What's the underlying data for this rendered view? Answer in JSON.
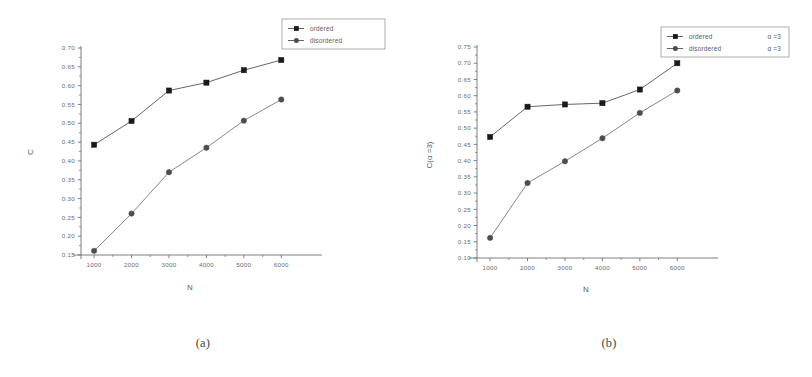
{
  "figure": {
    "panels": [
      {
        "id": "a",
        "caption": "(a)",
        "legend": {
          "entries": [
            {
              "label": "ordered",
              "marker": "square-marker"
            },
            {
              "label": "disordered",
              "marker": "circle-marker"
            }
          ]
        },
        "chart_data": {
          "type": "line",
          "title": "",
          "xlabel": "N",
          "ylabel": "C",
          "x": [
            1000,
            2000,
            3000,
            4000,
            5000,
            6000
          ],
          "xtick_labels": [
            "1000",
            "2000",
            "3000",
            "4000",
            "5000",
            "6000"
          ],
          "ytick_labels": [
            "0.15",
            "0.20",
            "0.25",
            "0.30",
            "0.35",
            "0.40",
            "0.45",
            "0.50",
            "0.55",
            "0.60",
            "0.65",
            "0.70"
          ],
          "yticks": [
            0.15,
            0.2,
            0.25,
            0.3,
            0.35,
            0.4,
            0.45,
            0.5,
            0.55,
            0.6,
            0.65,
            0.7
          ],
          "xlim": [
            650,
            6500
          ],
          "ylim": [
            0.15,
            0.7
          ],
          "grid": false,
          "legend_position": "top-right",
          "series": [
            {
              "name": "ordered",
              "marker": "square-marker",
              "color": "#1a1a1a",
              "values": [
                0.443,
                0.506,
                0.587,
                0.608,
                0.641,
                0.668
              ]
            },
            {
              "name": "disordered",
              "marker": "circle-marker",
              "color": "#4d4d4d",
              "values": [
                0.161,
                0.26,
                0.37,
                0.435,
                0.507,
                0.563
              ]
            }
          ]
        }
      },
      {
        "id": "b",
        "caption": "(b)",
        "legend": {
          "entries": [
            {
              "label": "ordered",
              "suffix": "α =3",
              "marker": "square-marker"
            },
            {
              "label": "disordered",
              "suffix": "α =3",
              "marker": "circle-marker"
            }
          ]
        },
        "chart_data": {
          "type": "line",
          "title": "",
          "xlabel": "N",
          "ylabel": "C(α =3)",
          "x": [
            1000,
            2000,
            3000,
            4000,
            5000,
            6000
          ],
          "xtick_labels": [
            "1000",
            "2000",
            "3000",
            "4000",
            "5000",
            "6000"
          ],
          "ytick_labels": [
            "0.10",
            "0.15",
            "0.20",
            "0.25",
            "0.30",
            "0.35",
            "0.40",
            "0.45",
            "0.50",
            "0.55",
            "0.60",
            "0.65",
            "0.70",
            "0.75"
          ],
          "yticks": [
            0.1,
            0.15,
            0.2,
            0.25,
            0.3,
            0.35,
            0.4,
            0.45,
            0.5,
            0.55,
            0.6,
            0.65,
            0.7,
            0.75
          ],
          "xlim": [
            650,
            6500
          ],
          "ylim": [
            0.1,
            0.75
          ],
          "grid": false,
          "legend_position": "top-right",
          "series": [
            {
              "name": "ordered α =3",
              "marker": "square-marker",
              "color": "#1a1a1a",
              "values": [
                0.473,
                0.566,
                0.573,
                0.577,
                0.619,
                0.7
              ]
            },
            {
              "name": "disordered α =3",
              "marker": "circle-marker",
              "color": "#4d4d4d",
              "values": [
                0.162,
                0.331,
                0.398,
                0.469,
                0.547,
                0.616
              ]
            }
          ]
        }
      }
    ]
  }
}
